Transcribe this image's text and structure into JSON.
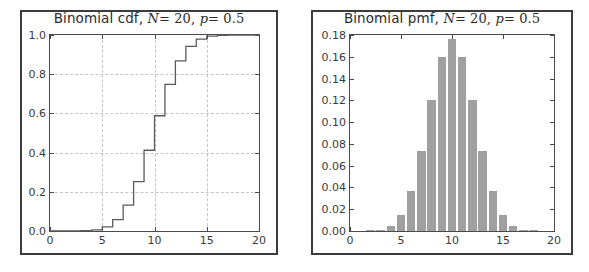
{
  "figure": {
    "width": 589,
    "height": 272,
    "background": "#ffffff",
    "frame_color": "#3c3c3c",
    "axis_color": "#4a4a4a",
    "grid_color": "#c4c4c4",
    "bar_color": "#a0a0a0",
    "line_color": "#5a5a5a"
  },
  "chart_data": [
    {
      "type": "line",
      "id": "binomial-cdf",
      "title": "Binomial cdf, N = 20, p = 0.5",
      "title_parts": {
        "text": "Binomial cdf,",
        "param_n_symbol": "N",
        "param_n_eq": "= 20,",
        "param_p_symbol": "p",
        "param_p_eq": "= 0.5"
      },
      "xlabel": "",
      "ylabel": "",
      "xlim": [
        0,
        20
      ],
      "ylim": [
        0.0,
        1.0
      ],
      "xticks": [
        0,
        5,
        10,
        15,
        20
      ],
      "xticklabels": [
        "0",
        "5",
        "10",
        "15",
        "20"
      ],
      "yticks": [
        0.0,
        0.2,
        0.4,
        0.6,
        0.8,
        1.0
      ],
      "yticklabels": [
        "0.0",
        "0.2",
        "0.4",
        "0.6",
        "0.8",
        "1.0"
      ],
      "grid": true,
      "grid_style": "dashed",
      "legend": null,
      "drawstyle": "steps-post",
      "x": [
        0,
        1,
        2,
        3,
        4,
        5,
        6,
        7,
        8,
        9,
        10,
        11,
        12,
        13,
        14,
        15,
        16,
        17,
        18,
        19,
        20
      ],
      "values": [
        0.0,
        0.0,
        0.0002,
        0.0013,
        0.0059,
        0.0207,
        0.0577,
        0.1316,
        0.2517,
        0.4119,
        0.5881,
        0.7483,
        0.8684,
        0.9423,
        0.9793,
        0.9941,
        0.9987,
        0.9998,
        1.0,
        1.0,
        1.0
      ]
    },
    {
      "type": "bar",
      "id": "binomial-pmf",
      "title": "Binomial pmf, N = 20, p = 0.5",
      "title_parts": {
        "text": "Binomial pmf,",
        "param_n_symbol": "N",
        "param_n_eq": "= 20,",
        "param_p_symbol": "p",
        "param_p_eq": "= 0.5"
      },
      "xlabel": "",
      "ylabel": "",
      "xlim": [
        0,
        20
      ],
      "ylim": [
        0.0,
        0.18
      ],
      "xticks": [
        0,
        5,
        10,
        15,
        20
      ],
      "xticklabels": [
        "0",
        "5",
        "10",
        "15",
        "20"
      ],
      "yticks": [
        0.0,
        0.02,
        0.04,
        0.06,
        0.08,
        0.1,
        0.12,
        0.14,
        0.16,
        0.18
      ],
      "yticklabels": [
        "0.00",
        "0.02",
        "0.04",
        "0.06",
        "0.08",
        "0.10",
        "0.12",
        "0.14",
        "0.16",
        "0.18"
      ],
      "grid": false,
      "legend": null,
      "categories": [
        0,
        1,
        2,
        3,
        4,
        5,
        6,
        7,
        8,
        9,
        10,
        11,
        12,
        13,
        14,
        15,
        16,
        17,
        18,
        19,
        20
      ],
      "values": [
        0.0,
        0.0,
        0.0002,
        0.0011,
        0.0046,
        0.0148,
        0.037,
        0.0739,
        0.1201,
        0.1602,
        0.1762,
        0.1602,
        0.1201,
        0.0739,
        0.037,
        0.0148,
        0.0046,
        0.0011,
        0.0002,
        0.0,
        0.0
      ]
    }
  ]
}
